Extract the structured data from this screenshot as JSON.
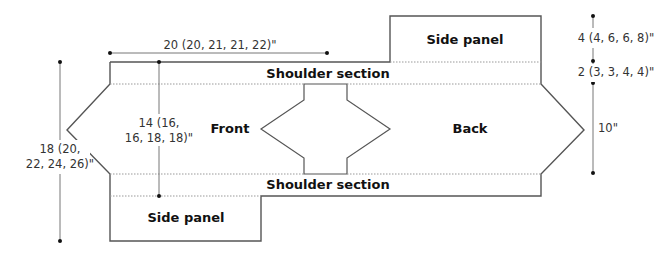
{
  "diagram": {
    "type": "knitting-schematic",
    "pieces": {
      "side_panel_top": "Side panel",
      "shoulder_top": "Shoulder section",
      "front": "Front",
      "back": "Back",
      "shoulder_bottom": "Shoulder section",
      "side_panel_bottom": "Side panel"
    },
    "dimensions": {
      "width_top": "20 (20, 21, 21, 22)\"",
      "front_height_line1": "14 (16,",
      "front_height_line2": "16, 18, 18)\"",
      "total_height_line1": "18 (20,",
      "total_height_line2": "22, 24, 26)\"",
      "side_panel_depth": "4 (4, 6, 6, 8)\"",
      "shoulder_depth": "2 (3, 3, 4, 4)\"",
      "body_height": "10\""
    },
    "colors": {
      "outline": "#555555",
      "dotted": "#999999",
      "dim_line": "#777777",
      "text": "#111111"
    }
  }
}
